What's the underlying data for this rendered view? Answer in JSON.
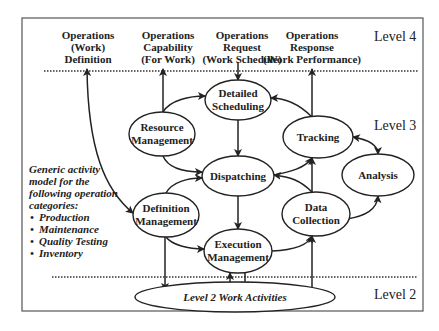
{
  "levels": {
    "level4": "Level 4",
    "level3": "Level 3",
    "level2": "Level 2"
  },
  "level4_outputs": [
    {
      "lines": [
        "Operations",
        "(Work)",
        "Definition"
      ]
    },
    {
      "lines": [
        "Operations",
        "Capability",
        "(For Work)"
      ]
    },
    {
      "lines": [
        "Operations",
        "Request",
        "(Work Schedule)"
      ]
    },
    {
      "lines": [
        "Operations",
        "Response",
        "(Work Performance)"
      ]
    }
  ],
  "nodes": {
    "detailed_scheduling": [
      "Detailed",
      "Scheduling"
    ],
    "resource_management": [
      "Resource",
      "Management"
    ],
    "tracking": [
      "Tracking"
    ],
    "dispatching": [
      "Dispatching"
    ],
    "analysis": [
      "Analysis"
    ],
    "definition_management": [
      "Definition",
      "Management"
    ],
    "data_collection": [
      "Data",
      "Collection"
    ],
    "execution_management": [
      "Execution",
      "Management"
    ],
    "level2_work_activities": [
      "Level 2 Work  Activities"
    ]
  },
  "side_note": {
    "lines": [
      "Generic activity",
      "model for the",
      "following operation",
      "categories:"
    ],
    "bullets": [
      "Production",
      "Maintenance",
      "Quality Testing",
      "Inventory"
    ]
  },
  "colors": {
    "line": "#222222",
    "background": "#ffffff",
    "frame": "#555555"
  }
}
